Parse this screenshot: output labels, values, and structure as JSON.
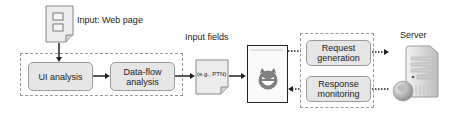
{
  "diagram": {
    "input_label": "Input: Web page",
    "analysis": {
      "ui_analysis": "UI analysis",
      "data_flow_line1": "Data-flow",
      "data_flow_line2": "analysis"
    },
    "input_fields_label": "Input fields",
    "input_fields_example": "(e.g., PTN)",
    "attacker_icon": "devil-face-icon",
    "fuzzer": {
      "request_line1": "Request",
      "request_line2": "generation",
      "response_line1": "Response",
      "response_line2": "monitoring"
    },
    "server_label": "Server",
    "colors": {
      "box_fill": "#e6e6e6",
      "box_border": "#9a9a9a",
      "dashed_border": "#999999",
      "arrow": "#222222"
    }
  }
}
